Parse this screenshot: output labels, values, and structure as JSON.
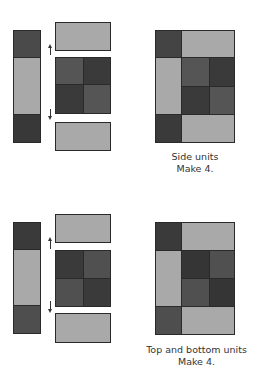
{
  "colors": {
    "light": "#a9a9a9",
    "dark_a": "#4a4a4a",
    "dark_b": "#3a3a3a",
    "medium": "#555555",
    "seam": "#2a2a2a"
  },
  "diagrams": [
    {
      "name": "side-units",
      "caption_line1": "Side units",
      "caption_line2": "Make 4."
    },
    {
      "name": "top-and-bottom-units",
      "caption_line1": "Top and bottom units",
      "caption_line2": "Make 4."
    }
  ]
}
